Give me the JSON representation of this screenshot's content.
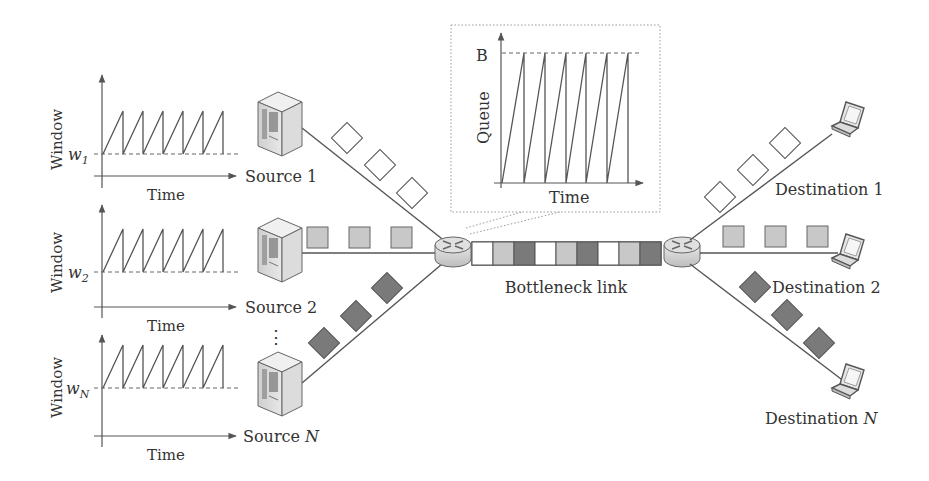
{
  "diagram": {
    "colors": {
      "line": "#555555",
      "packet_white": "#ffffff",
      "packet_light": "#c8c8c8",
      "packet_dark": "#7a7a7a",
      "dashed": "#666666",
      "device_face": "#e4e4e4",
      "device_shade": "#bdbdbd"
    },
    "window_plots": [
      {
        "ylabel": "Window",
        "threshold_var": "w",
        "threshold_sub": "1",
        "xlabel": "Time",
        "source_label": "Source 1",
        "source_italic": ""
      },
      {
        "ylabel": "Window",
        "threshold_var": "w",
        "threshold_sub": "2",
        "xlabel": "Time",
        "source_label": "Source 2",
        "source_italic": ""
      },
      {
        "ylabel": "Window",
        "threshold_var": "w",
        "threshold_sub": "N",
        "xlabel": "Time",
        "source_label": "Source ",
        "source_italic": "N"
      }
    ],
    "ellipsis": "⋮",
    "queue_inset": {
      "ylabel": "Queue",
      "xlabel": "Time",
      "max_label": "B"
    },
    "bottleneck_label": "Bottleneck link",
    "bottleneck_packets": [
      "white",
      "light",
      "dark",
      "white",
      "light",
      "dark",
      "white",
      "light",
      "dark"
    ],
    "destinations": [
      {
        "label": "Destination 1",
        "italic": ""
      },
      {
        "label": "Destination 2",
        "italic": ""
      },
      {
        "label": "Destination ",
        "italic": "N"
      }
    ],
    "icons": {
      "source": "server-icon",
      "router": "router-icon",
      "destination": "laptop-icon"
    }
  }
}
